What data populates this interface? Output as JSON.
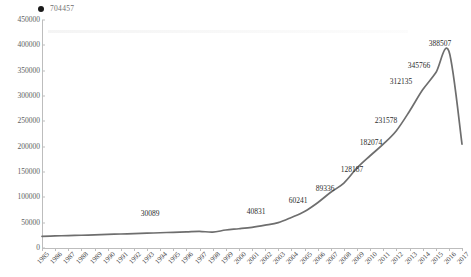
{
  "legend": {
    "marker_icon": "filled-circle-icon",
    "label": "704457",
    "color": "#1a1a1a"
  },
  "axes": {
    "y_ticks": [
      "450000",
      "400000",
      "350000",
      "300000",
      "250000",
      "200000",
      "150000",
      "100000",
      "50000",
      "0"
    ],
    "x_ticks": [
      "1985",
      "1986",
      "1987",
      "1988",
      "1989",
      "1990",
      "1991",
      "1992",
      "1993",
      "1994",
      "1995",
      "1996",
      "1997",
      "1998",
      "1999",
      "2000",
      "2001",
      "2002",
      "2003",
      "2004",
      "2005",
      "2006",
      "2007",
      "2008",
      "2009",
      "2010",
      "2011",
      "2012",
      "2013",
      "2014",
      "2015",
      "2016",
      "2017"
    ],
    "line_color": "#6e6e6e",
    "axis_color": "#bdbdbd",
    "tick_label_color": "#5e5e5e"
  },
  "data_labels": [
    {
      "text": "30089",
      "x": 150,
      "y": 214
    },
    {
      "text": "40831",
      "x": 256,
      "y": 212
    },
    {
      "text": "60241",
      "x": 298,
      "y": 201
    },
    {
      "text": "89336",
      "x": 325,
      "y": 189
    },
    {
      "text": "128187",
      "x": 352,
      "y": 170
    },
    {
      "text": "182074",
      "x": 371,
      "y": 143
    },
    {
      "text": "231578",
      "x": 386,
      "y": 121
    },
    {
      "text": "312135",
      "x": 401,
      "y": 82
    },
    {
      "text": "345766",
      "x": 419,
      "y": 66
    },
    {
      "text": "388507",
      "x": 440,
      "y": 44
    }
  ],
  "chart_data": {
    "type": "line",
    "title": "",
    "xlabel": "",
    "ylabel": "",
    "ylim": [
      0,
      450000
    ],
    "grid": false,
    "legend_position": "top-left",
    "series_name": "704457",
    "x": [
      1985,
      1986,
      1987,
      1988,
      1989,
      1990,
      1991,
      1992,
      1993,
      1994,
      1995,
      1996,
      1997,
      1998,
      1999,
      2000,
      2001,
      2002,
      2003,
      2004,
      2005,
      2006,
      2007,
      2008,
      2009,
      2010,
      2011,
      2012,
      2013,
      2014,
      2015,
      2016,
      2017
    ],
    "values": [
      23000,
      23800,
      24500,
      25200,
      26000,
      26800,
      27600,
      28400,
      29200,
      30089,
      31000,
      31800,
      33000,
      31200,
      35500,
      38000,
      40831,
      45000,
      50000,
      60241,
      72000,
      89336,
      110000,
      128187,
      158000,
      182074,
      205000,
      231578,
      270000,
      312135,
      345766,
      388507,
      205000
    ],
    "labeled_points": {
      "1994": 30089,
      "2001": 40831,
      "2004": 60241,
      "2006": 89336,
      "2008": 128187,
      "2010": 182074,
      "2012": 231578,
      "2014": 312135,
      "2015": 345766,
      "2016": 388507
    }
  }
}
